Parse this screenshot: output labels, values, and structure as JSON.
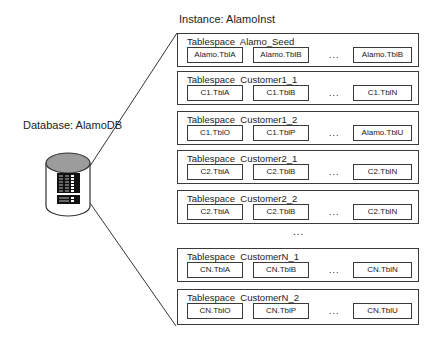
{
  "instance": {
    "label": "Instance: AlamoInst"
  },
  "database": {
    "label": "Database: AlamoDB",
    "icon": "database-cylinder-icon"
  },
  "between_ellipsis": "...",
  "tablespaces": [
    {
      "label": "Tablespace  Alamo_Seed",
      "tables": [
        "Alamo.TblA",
        "Alamo.TblB",
        "Alamo.TblB"
      ],
      "ellipsis": "..."
    },
    {
      "label": "Tablespace  Customer1_1",
      "tables": [
        "C1.TblA",
        "C1.TblB",
        "C1.TblN"
      ],
      "ellipsis": "..."
    },
    {
      "label": "Tablespace  Customer1_2",
      "tables": [
        "C1.TblO",
        "C1.TblP",
        "Alamo.TblU"
      ],
      "ellipsis": "..."
    },
    {
      "label": "Tablespace  Customer2_1",
      "tables": [
        "C2.TblA",
        "C2.TblB",
        "C2.TblN"
      ],
      "ellipsis": "..."
    },
    {
      "label": "Tablespace  Customer2_2",
      "tables": [
        "C2.TblA",
        "C2.TblB",
        "C2.TblN"
      ],
      "ellipsis": "..."
    },
    {
      "label": "Tablespace  CustomerN_1",
      "tables": [
        "CN.TblA",
        "CN.TblB",
        "CN.TblN"
      ],
      "ellipsis": "..."
    },
    {
      "label": "Tablespace  CustomerN_2",
      "tables": [
        "CN.TblO",
        "CN.TblP",
        "CN.TblU"
      ],
      "ellipsis": "..."
    }
  ]
}
